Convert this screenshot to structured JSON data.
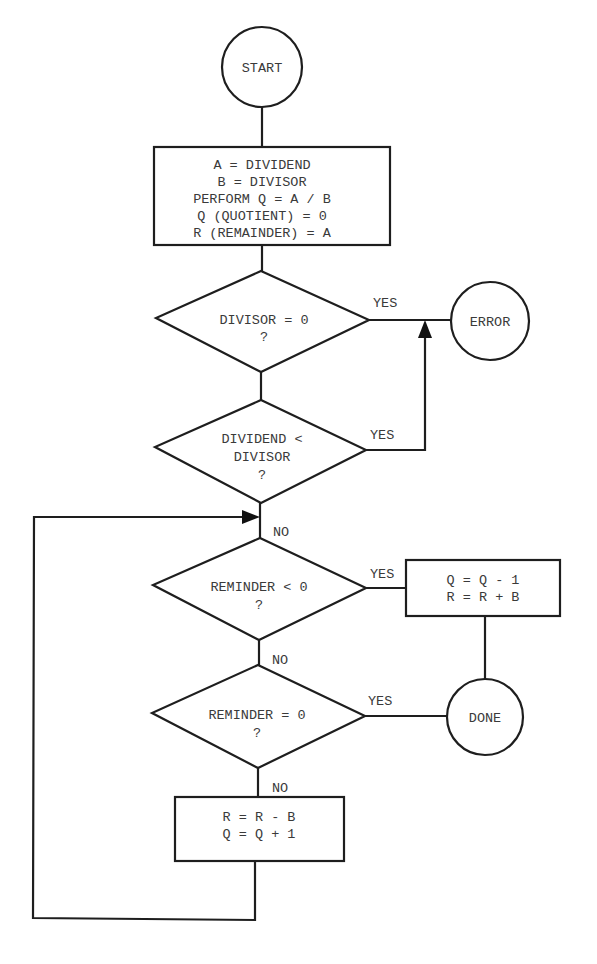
{
  "diagram": {
    "type": "flowchart",
    "nodes": {
      "start": {
        "shape": "circle",
        "label": "START"
      },
      "init": {
        "shape": "rectangle",
        "lines": [
          "A = DIVIDEND",
          "B = DIVISOR",
          "PERFORM Q = A / B",
          "Q (QUOTIENT) = 0",
          "R (REMAINDER) = A"
        ]
      },
      "check_divisor": {
        "shape": "diamond",
        "lines": [
          "DIVISOR = 0",
          "?"
        ]
      },
      "check_dividend": {
        "shape": "diamond",
        "lines": [
          "DIVIDEND <",
          "DIVISOR",
          "?"
        ]
      },
      "error": {
        "shape": "circle",
        "label": "ERROR"
      },
      "check_negative": {
        "shape": "diamond",
        "lines": [
          "REMINDER < 0",
          "?"
        ]
      },
      "adjust": {
        "shape": "rectangle",
        "lines": [
          "Q = Q - 1",
          "R = R + B"
        ]
      },
      "check_zero": {
        "shape": "diamond",
        "lines": [
          "REMINDER = 0",
          "?"
        ]
      },
      "done": {
        "shape": "circle",
        "label": "DONE"
      },
      "subtract": {
        "shape": "rectangle",
        "lines": [
          "R = R - B",
          "Q = Q + 1"
        ]
      }
    },
    "edge_labels": {
      "divisor_yes": "YES",
      "dividend_yes": "YES",
      "dividend_no": "NO",
      "negative_yes": "YES",
      "negative_no": "NO",
      "zero_yes": "YES",
      "zero_no": "NO"
    },
    "edges": [
      {
        "from": "start",
        "to": "init"
      },
      {
        "from": "init",
        "to": "check_divisor"
      },
      {
        "from": "check_divisor",
        "to": "error",
        "label": "YES"
      },
      {
        "from": "check_divisor",
        "to": "check_dividend"
      },
      {
        "from": "check_dividend",
        "to": "error",
        "label": "YES"
      },
      {
        "from": "check_dividend",
        "to": "check_negative",
        "label": "NO"
      },
      {
        "from": "check_negative",
        "to": "adjust",
        "label": "YES"
      },
      {
        "from": "adjust",
        "to": "done"
      },
      {
        "from": "check_negative",
        "to": "check_zero",
        "label": "NO"
      },
      {
        "from": "check_zero",
        "to": "done",
        "label": "YES"
      },
      {
        "from": "check_zero",
        "to": "subtract",
        "label": "NO"
      },
      {
        "from": "subtract",
        "to": "check_negative",
        "label": "loop"
      }
    ],
    "colors": {
      "line": "#1e1e1e",
      "text": "#3a3a3a",
      "background": "#ffffff"
    }
  }
}
